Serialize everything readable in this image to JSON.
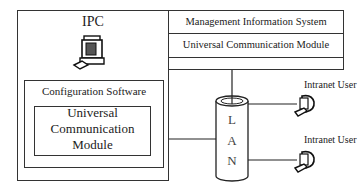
{
  "ipc": {
    "title": "IPC",
    "icon": "desktop-computer-icon",
    "configuration_software": {
      "title": "Configuration Software",
      "module": {
        "line1": "Universal",
        "line2": "Communication",
        "line3": "Module"
      }
    }
  },
  "server_stack": {
    "management": "Management Information System",
    "communication": "Universal Communication Module"
  },
  "lan": {
    "letters": [
      "L",
      "A",
      "N"
    ]
  },
  "intranet_users": [
    {
      "label": "Intranet User",
      "icon": "desktop-computer-icon"
    },
    {
      "label": "Intranet User",
      "icon": "desktop-computer-icon"
    }
  ]
}
